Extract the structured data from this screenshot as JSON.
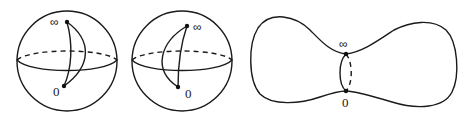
{
  "figure": {
    "panels": [
      {
        "id": "sphere-left",
        "type": "sphere",
        "labels": {
          "top": "∞",
          "bottom": "0"
        },
        "description": "Sphere with dashed back-equator and two curves joining ∞ and 0, the second bulging right"
      },
      {
        "id": "sphere-middle",
        "type": "sphere",
        "labels": {
          "top": "∞",
          "bottom": "0"
        },
        "description": "Sphere with dashed back-equator and two curves joining ∞ and 0, the second bulging left"
      },
      {
        "id": "pinched-surface",
        "type": "peanut",
        "labels": {
          "top": "∞",
          "bottom": "0"
        },
        "description": "Dumbbell-shaped surface with a neck circle through ∞ and 0 (front solid, back dashed)"
      }
    ],
    "colors": {
      "line": "#1a1a1a",
      "background": "#ffffff"
    }
  }
}
